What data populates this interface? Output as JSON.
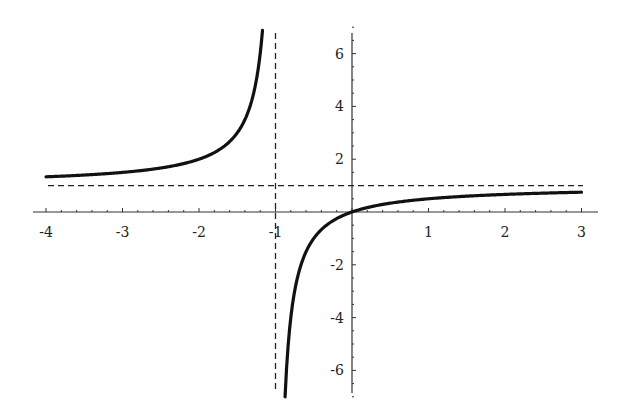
{
  "chart_data": {
    "type": "line",
    "title": "",
    "xlabel": "",
    "ylabel": "",
    "function": "y = x/(x+1)",
    "xlim": [
      -4,
      3
    ],
    "ylim": [
      -7,
      7
    ],
    "grid": false,
    "legend": null,
    "x_ticks": [
      -4,
      -3,
      -2,
      -1,
      1,
      2,
      3
    ],
    "x_tick_labels": [
      "-4",
      "-3",
      "-2",
      "-1",
      "1",
      "2",
      "3"
    ],
    "y_ticks": [
      -6,
      -4,
      -2,
      2,
      4,
      6
    ],
    "y_tick_labels": [
      "-6",
      "-4",
      "-2",
      "2",
      "4",
      "6"
    ],
    "series": [
      {
        "name": "left branch",
        "x": [
          -4,
          -3.5,
          -3,
          -2.5,
          -2,
          -1.75,
          -1.5,
          -1.4,
          -1.3,
          -1.25,
          -1.2,
          -1.17
        ],
        "values": [
          1.333,
          1.4,
          1.5,
          1.667,
          2,
          2.333,
          3,
          3.5,
          4.333,
          5,
          6,
          6.88
        ]
      },
      {
        "name": "right branch",
        "x": [
          -0.875,
          -0.85,
          -0.8,
          -0.75,
          -0.7,
          -0.6,
          -0.5,
          -0.4,
          -0.2,
          0,
          0.5,
          1,
          1.5,
          2,
          2.5,
          3
        ],
        "values": [
          -7,
          -5.667,
          -4,
          -3,
          -2.333,
          -1.5,
          -1,
          -0.667,
          -0.25,
          0,
          0.333,
          0.5,
          0.6,
          0.667,
          0.714,
          0.75
        ]
      }
    ],
    "asymptotes": [
      {
        "type": "vertical",
        "x": -1,
        "style": "dashed"
      },
      {
        "type": "horizontal",
        "y": 1,
        "style": "dashed"
      }
    ]
  },
  "colors": {
    "curve": "#111111",
    "axis": "#333333",
    "asymptote": "#222222",
    "background": "#ffffff"
  }
}
